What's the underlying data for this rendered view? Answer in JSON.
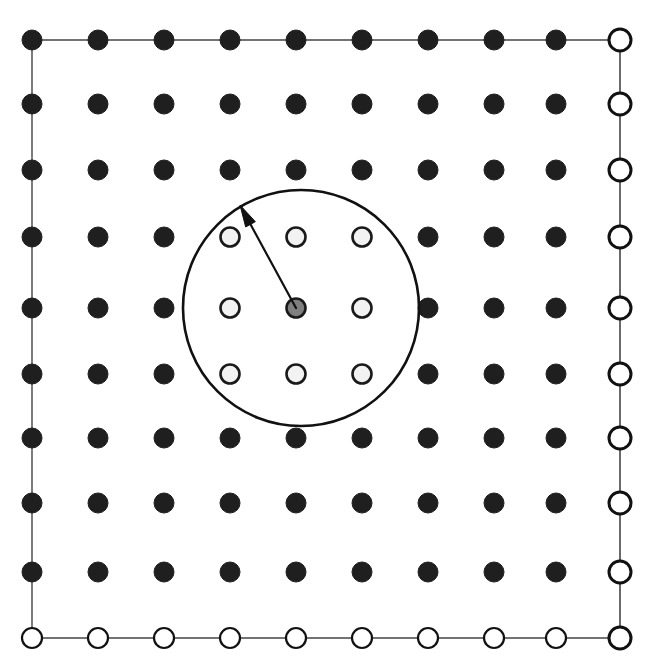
{
  "figure": {
    "kind": "lattice-neighborhood-diagram",
    "width": 657,
    "height": 665,
    "background_color": "#ffffff",
    "cropped_header_text": "",
    "description_caption": ""
  },
  "colors": {
    "filled_node_fill": "#1f1f1f",
    "filled_node_stroke": "#1f1f1f",
    "image_node_fill": "#ffffff",
    "image_node_stroke": "#111111",
    "neighbor_node_fill": "#f2f2f2",
    "neighbor_node_stroke": "#1a1a1a",
    "center_node_fill": "#7f7f7f",
    "center_node_stroke": "#1a1a1a",
    "boundary_line": "#444444",
    "cutoff_circle_stroke": "#111111",
    "arrow_color": "#111111"
  },
  "geometry": {
    "columns_x": [
      32,
      98,
      164,
      230,
      296,
      362,
      428,
      494,
      556,
      620
    ],
    "rows_y": [
      40,
      104,
      170,
      237,
      308,
      374,
      438,
      503,
      572,
      638
    ],
    "node_radius_filled": 10,
    "node_radius_image_right": 11,
    "node_radius_image_bottom": 10,
    "node_radius_neighbor": 9.5,
    "node_radius_center": 9.5,
    "grid_rows": 10,
    "grid_columns": 10
  },
  "cutoff_circle": {
    "label": "cutoff-radius-circle",
    "center_x": 301,
    "center_y": 308,
    "radius": 118,
    "stroke_width": 2.6
  },
  "center_node": {
    "label": "reference-particle",
    "x": 296,
    "y": 308
  },
  "arrow": {
    "label": "displacement-vector",
    "from_x": 296,
    "from_y": 308,
    "to_x": 240,
    "to_y": 205,
    "head_length": 22,
    "head_width": 11,
    "line_width": 2.2
  },
  "neighbor_nodes": [
    {
      "x": 230,
      "y": 237
    },
    {
      "x": 296,
      "y": 237
    },
    {
      "x": 362,
      "y": 237
    },
    {
      "x": 230,
      "y": 308
    },
    {
      "x": 362,
      "y": 308
    },
    {
      "x": 230,
      "y": 374
    },
    {
      "x": 296,
      "y": 374
    },
    {
      "x": 362,
      "y": 374
    }
  ],
  "boundary_edges": {
    "top_row_y": 40,
    "left_column_x": 32,
    "right_column_x": 620,
    "bottom_row_y": 638,
    "line_width_inner": 1.4,
    "line_width_outer": 1.6
  },
  "legend_notes": {
    "filled": "interior lattice node",
    "open": "periodic image node",
    "light": "node inside cutoff",
    "gray": "reference node"
  }
}
